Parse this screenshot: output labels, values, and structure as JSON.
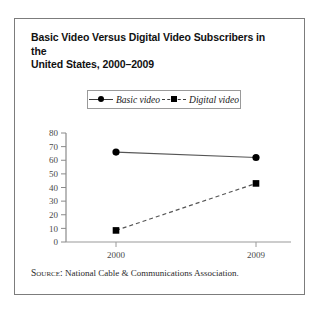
{
  "figure": {
    "title_line1": "Basic Video Versus Digital Video Subscribers in the",
    "title_line2": "United States, 2000–2009",
    "source_label": "Source:",
    "source_text": " National Cable & Communications Association."
  },
  "legend": {
    "position": "top-center",
    "entries": [
      {
        "label": "Basic video",
        "marker": "circle",
        "line": "solid",
        "color": "#000000"
      },
      {
        "label": "Digital video",
        "marker": "square",
        "line": "dashed",
        "color": "#000000"
      }
    ]
  },
  "axes": {
    "y_ticks": [
      "80",
      "70",
      "60",
      "50",
      "40",
      "30",
      "20",
      "10",
      "0"
    ],
    "x_ticks": [
      "2000",
      "2009"
    ]
  },
  "chart_data": {
    "type": "line",
    "title": "Basic Video Versus Digital Video Subscribers in the United States, 2000–2009",
    "xlabel": "",
    "ylabel": "",
    "categories": [
      "2000",
      "2009"
    ],
    "x": [
      2000,
      2009
    ],
    "series": [
      {
        "name": "Basic video",
        "values": [
          66,
          62
        ],
        "marker": "circle",
        "line": "solid"
      },
      {
        "name": "Digital video",
        "values": [
          8.5,
          43
        ],
        "marker": "square",
        "line": "dashed"
      }
    ],
    "ylim": [
      0,
      80
    ],
    "ytick_step": 10,
    "grid": false,
    "legend_position": "top-center",
    "source": "National Cable & Communications Association."
  }
}
